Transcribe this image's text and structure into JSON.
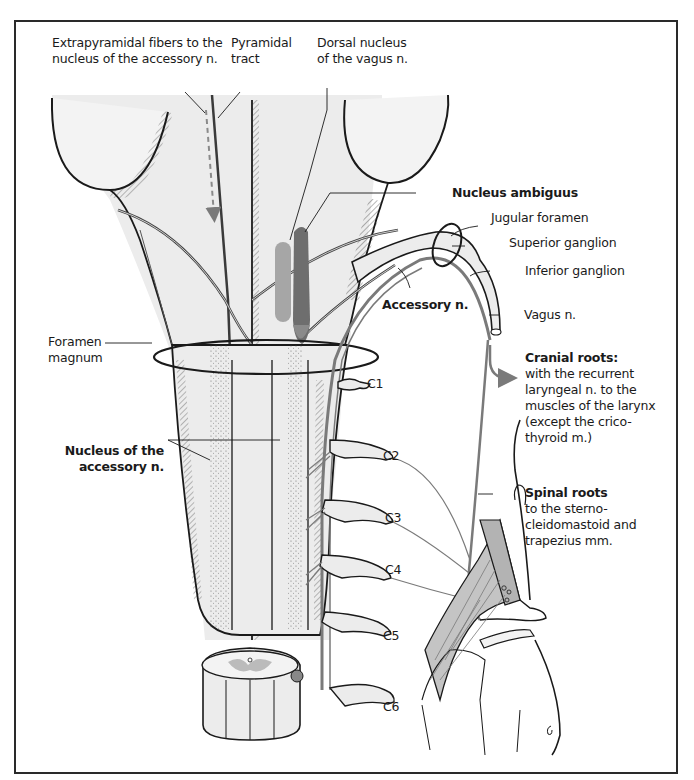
{
  "figure": {
    "colors": {
      "frame": "#2a2a2a",
      "tissue_fill": "#ececec",
      "outline": "#1a1a1a",
      "nerve_gray": "#7a7a7a",
      "dorsal_nucleus_fill": "#9a9a9a",
      "nucleus_ambiguus_fill": "#6e6e6e",
      "muscle_fill": "#bdbdbd"
    }
  },
  "labels": {
    "extrapyramidal": [
      "Extrapyramidal fibers to the",
      "nucleus of the accessory n."
    ],
    "pyramidal": [
      "Pyramidal",
      "tract"
    ],
    "dorsal_nucleus": [
      "Dorsal nucleus",
      "of the vagus n."
    ],
    "nucleus_ambiguus": "Nucleus ambiguus",
    "jugular_foramen": "Jugular foramen",
    "superior_ganglion": "Superior ganglion",
    "inferior_ganglion": "Inferior ganglion",
    "accessory_n": "Accessory n.",
    "vagus_n": "Vagus n.",
    "foramen_magnum": [
      "Foramen",
      "magnum"
    ],
    "cranial_roots": {
      "title": "Cranial roots:",
      "lines": [
        "with the recurrent",
        "laryngeal n. to the",
        "muscles of the larynx",
        "(except the crico-",
        "thyroid m.)"
      ]
    },
    "spinal_roots": {
      "title": "Spinal roots",
      "lines": [
        "to the sterno-",
        "cleidomastoid and",
        "trapezius mm."
      ]
    },
    "nucleus_accessory": [
      "Nucleus of the",
      "accessory n."
    ],
    "cervical": [
      "C1",
      "C2",
      "C3",
      "C4",
      "C5",
      "C6"
    ]
  }
}
